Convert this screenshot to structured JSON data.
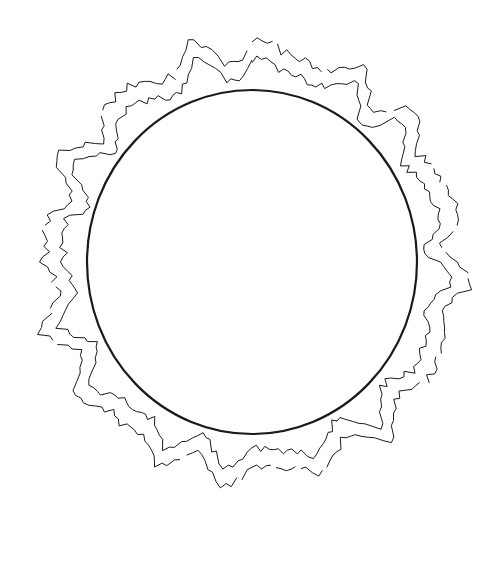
{
  "image": {
    "subject": "sun with corona line drawing",
    "background_color": "#ffffff",
    "line_color": "#1a1a1a"
  },
  "sun_disc": {
    "cx": 252,
    "cy": 262,
    "rx": 165,
    "ry": 172,
    "stroke_width": 2.2
  },
  "corona": {
    "inner_radius_min": 178,
    "inner_radius_max": 215,
    "outer_offset": 12,
    "stroke_width": 1
  }
}
